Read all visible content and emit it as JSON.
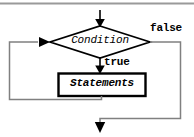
{
  "diagram": {
    "background_color": "#ffffff",
    "stroke_color": "#000000",
    "loop_stroke_color": "#808080",
    "rule_color": "#a0a0a0",
    "nodes": {
      "decision": {
        "label": "Condition",
        "shape": "diamond",
        "name": "condition-decision"
      },
      "process": {
        "label": "Statements",
        "shape": "rectangle",
        "name": "statements-process"
      }
    },
    "edges": {
      "entry": {
        "label": "",
        "name": "entry-arrow"
      },
      "true_branch": {
        "label": "true",
        "name": "true-branch"
      },
      "false_branch": {
        "label": "false",
        "name": "false-branch"
      },
      "loop_back": {
        "label": "",
        "name": "loop-back-edge"
      },
      "exit": {
        "label": "",
        "name": "exit-arrow"
      }
    },
    "top_rule": {
      "name": "top-horizontal-rule"
    }
  }
}
